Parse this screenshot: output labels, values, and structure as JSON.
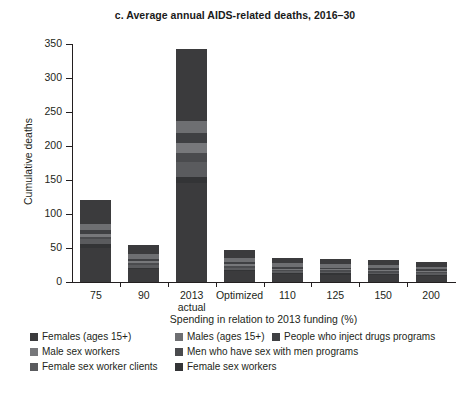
{
  "chart_data": {
    "type": "bar",
    "stacked": true,
    "title": "c. Average annual AIDS-related deaths, 2016–30",
    "xlabel": "Spending in relation to 2013 funding (%)",
    "ylabel": "Cumulative deaths",
    "categories": [
      "75",
      "90",
      "2013\nactual",
      "Optimized",
      "110",
      "125",
      "150",
      "200"
    ],
    "ylim": [
      0,
      350
    ],
    "yticks": [
      0,
      50,
      100,
      150,
      200,
      250,
      300,
      350
    ],
    "ytick_labels": [
      "0",
      "50",
      "100",
      "150",
      "200",
      "250",
      "300",
      "350"
    ],
    "grid": false,
    "legend_position": "below",
    "series": [
      {
        "name": "Females (ages 15+)",
        "color": "#3b3b3d",
        "values": [
          86,
          33,
          250,
          28,
          20,
          19,
          17,
          15
        ]
      },
      {
        "name": "Males (ages 15+)",
        "color": "#6e6f72",
        "values": [
          9,
          7,
          18,
          6,
          5,
          5,
          5,
          4
        ]
      },
      {
        "name": "People who inject drugs programs",
        "color": "#3f4043",
        "values": [
          5,
          3,
          15,
          3,
          3,
          2,
          2,
          2
        ]
      },
      {
        "name": "Male sex workers",
        "color": "#77787b",
        "values": [
          4,
          3,
          14,
          3,
          2,
          2,
          2,
          2
        ],
        "note": "light band near top of stack"
      },
      {
        "name": "Men who have sex with men programs",
        "color": "#4a4b4e",
        "values": [
          3,
          3,
          13,
          2,
          2,
          2,
          2,
          2
        ]
      },
      {
        "name": "Female sex worker clients",
        "color": "#5a5b5e",
        "values": [
          8,
          4,
          22,
          3,
          2,
          2,
          2,
          2
        ]
      },
      {
        "name": "Female sex workers",
        "color": "#333436",
        "values": [
          6,
          2,
          10,
          2,
          2,
          2,
          2,
          2
        ]
      }
    ],
    "totals": [
      121,
      55,
      342,
      47,
      36,
      34,
      32,
      29
    ]
  },
  "legend": {
    "rows": [
      [
        {
          "label": "Females (ages 15+)",
          "color": "#3b3b3d",
          "left": 0
        },
        {
          "label": "Males (ages 15+)",
          "color": "#6e6f72",
          "left": 145
        },
        {
          "label": "People who inject drugs programs",
          "color": "#3f4043",
          "left": 242
        }
      ],
      [
        {
          "label": "Male sex workers",
          "color": "#77787b",
          "left": 0
        },
        {
          "label": "Men who have sex with men programs",
          "color": "#4a4b4e",
          "left": 145
        }
      ],
      [
        {
          "label": "Female sex worker clients",
          "color": "#5a5b5e",
          "left": 0
        },
        {
          "label": "Female sex workers",
          "color": "#333436",
          "left": 145
        }
      ]
    ]
  }
}
